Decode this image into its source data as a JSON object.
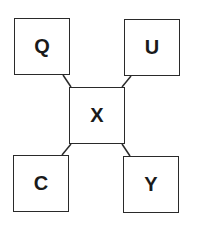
{
  "diagram": {
    "nodes": [
      {
        "id": "Q",
        "label": "Q",
        "x": 14,
        "y": 18,
        "w": 56,
        "h": 57
      },
      {
        "id": "U",
        "label": "U",
        "x": 124,
        "y": 19,
        "w": 56,
        "h": 57
      },
      {
        "id": "X",
        "label": "X",
        "x": 69,
        "y": 87,
        "w": 56,
        "h": 57
      },
      {
        "id": "C",
        "label": "C",
        "x": 13,
        "y": 155,
        "w": 56,
        "h": 57
      },
      {
        "id": "Y",
        "label": "Y",
        "x": 123,
        "y": 156,
        "w": 56,
        "h": 57
      }
    ],
    "edges": [
      {
        "from": "Q",
        "to": "X"
      },
      {
        "from": "U",
        "to": "X"
      },
      {
        "from": "X",
        "to": "C"
      },
      {
        "from": "X",
        "to": "Y"
      }
    ],
    "line_color": "#2a2a2a"
  }
}
